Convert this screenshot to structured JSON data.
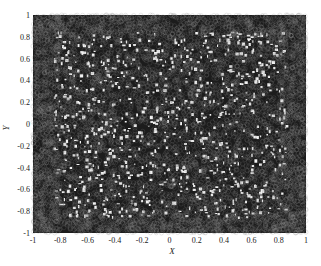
{
  "chart_data": {
    "type": "scatter",
    "title": "",
    "xlabel": "X",
    "ylabel": "Y",
    "xlim": [
      -1,
      1
    ],
    "ylim": [
      -1,
      1
    ],
    "x_ticks": [
      "-1",
      "-0.8",
      "-0.6",
      "-0.4",
      "-0.2",
      "0",
      "0.2",
      "0.4",
      "0.6",
      "0.8",
      "1"
    ],
    "y_ticks": [
      "1",
      "0.8",
      "0.6",
      "0.4",
      "0.2",
      "0",
      "-0.2",
      "-0.4",
      "-0.6",
      "-0.8",
      "-1"
    ],
    "grid": false,
    "legend": null,
    "marker": "open circle",
    "marker_color": "#1a1a1a",
    "series": [
      {
        "name": "points",
        "description": "Dense uniform scatter of several thousand points filling the square [-1,1]x[-1,1]; markers denser/overlapping near the edges and corners, with small white gaps scattered through the interior",
        "approx_count": 6000,
        "distribution": "uniform",
        "x_range": [
          -1,
          1
        ],
        "y_range": [
          -1,
          1
        ]
      }
    ]
  },
  "render": {
    "seed": 12345,
    "count": 6000,
    "edge_extra": 1500
  }
}
